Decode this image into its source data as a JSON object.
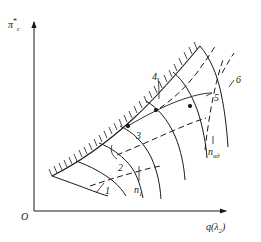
{
  "figure": {
    "type": "compressor-characteristic-map",
    "background": "#ffffff",
    "line_color": "#1a1a1a"
  },
  "axes": {
    "origin_label": "O",
    "y_axis": {
      "symbol": "π",
      "superscript": "*",
      "subscript": "c",
      "full_label": "π*c"
    },
    "x_axis": {
      "symbol": "q",
      "argument": "λ",
      "arg_subscript": "2",
      "full_label": "q(λ₂)"
    }
  },
  "curve_labels": [
    {
      "id": "label-1",
      "text": "1",
      "x": 105,
      "y": 186
    },
    {
      "id": "label-2",
      "text": "2",
      "x": 118,
      "y": 163
    },
    {
      "id": "label-3",
      "text": "3",
      "x": 136,
      "y": 131
    },
    {
      "id": "label-4",
      "text": "4",
      "x": 152,
      "y": 72
    },
    {
      "id": "label-5",
      "text": "5",
      "x": 214,
      "y": 93
    },
    {
      "id": "label-6",
      "text": "6",
      "x": 236,
      "y": 75
    }
  ],
  "speed_line_labels": [
    {
      "id": "n-min",
      "symbol": "n",
      "subscript": "1",
      "x": 135,
      "y": 186
    },
    {
      "id": "n-max",
      "symbol": "n",
      "subscript": "ид",
      "x": 210,
      "y": 148
    }
  ],
  "legend_description": {
    "solid_curves": "constant rotational speed lines",
    "dashed_curves": "constant efficiency lines",
    "hatched_line": "surge boundary"
  }
}
